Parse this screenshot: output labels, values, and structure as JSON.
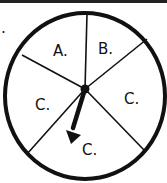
{
  "spinner": {
    "sections": [
      {
        "label": "A."
      },
      {
        "label": "B."
      },
      {
        "label": "C."
      },
      {
        "label": "C."
      },
      {
        "label": "C."
      }
    ],
    "stray_mark": "."
  },
  "colors": {
    "ink": "#111111",
    "background": "#ffffff"
  }
}
